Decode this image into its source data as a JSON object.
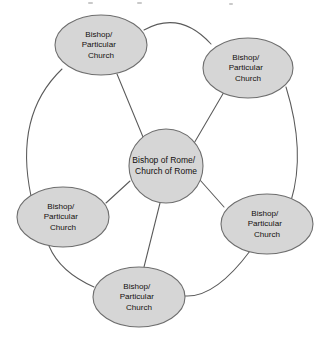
{
  "diagram": {
    "type": "network",
    "background_color": "#ffffff",
    "node_fill_color": "#d6d6d6",
    "node_stroke_color": "#6e6e6e",
    "edge_color": "#5a5a5a",
    "text_color": "#14100e",
    "center_node": {
      "id": "bishop-of-rome",
      "line1": "Bishop of Rome/",
      "line2": "Church of Rome",
      "cx": 166,
      "cy": 166,
      "r": 37
    },
    "peripheral_nodes": [
      {
        "id": "node-top-left",
        "line1": "Bishop/",
        "line2": "Particular",
        "line3": "Church",
        "cx": 101,
        "cy": 45,
        "rx": 46,
        "ry": 30
      },
      {
        "id": "node-top-right",
        "line1": "Bishop/",
        "line2": "Particular",
        "line3": "Church",
        "cx": 248,
        "cy": 68,
        "rx": 45,
        "ry": 30
      },
      {
        "id": "node-right",
        "line1": "Bishop/",
        "line2": "Particular",
        "line3": "Church",
        "cx": 267,
        "cy": 224,
        "rx": 46,
        "ry": 30
      },
      {
        "id": "node-bottom",
        "line1": "Bishop/",
        "line2": "Particular",
        "line3": "Church",
        "cx": 139,
        "cy": 297,
        "rx": 46,
        "ry": 30
      },
      {
        "id": "node-left",
        "line1": "Bishop/",
        "line2": "Particular",
        "line3": "Church",
        "cx": 63,
        "cy": 217,
        "rx": 46,
        "ry": 30
      }
    ],
    "spokes": [
      {
        "id": "spoke-top-left",
        "from": "bishop-of-rome",
        "to": "node-top-left"
      },
      {
        "id": "spoke-top-right",
        "from": "bishop-of-rome",
        "to": "node-top-right"
      },
      {
        "id": "spoke-right",
        "from": "bishop-of-rome",
        "to": "node-right"
      },
      {
        "id": "spoke-bottom",
        "from": "bishop-of-rome",
        "to": "node-bottom"
      },
      {
        "id": "spoke-left",
        "from": "bishop-of-rome",
        "to": "node-left"
      }
    ],
    "ring_arcs": [
      {
        "id": "arc-top",
        "from": "node-top-left",
        "to": "node-top-right"
      },
      {
        "id": "arc-right-upper",
        "from": "node-top-right",
        "to": "node-right"
      },
      {
        "id": "arc-bottom-right",
        "from": "node-right",
        "to": "node-bottom"
      },
      {
        "id": "arc-bottom-left",
        "from": "node-bottom",
        "to": "node-left"
      },
      {
        "id": "arc-left-upper",
        "from": "node-left",
        "to": "node-top-left"
      }
    ]
  }
}
